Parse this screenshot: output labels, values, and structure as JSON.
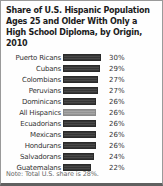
{
  "title": "Share of U.S. Hispanic Population Ages 25 and Older With Only a High School Diploma, by Origin, 2010",
  "note": "Note: Total U.S. share is 28%.",
  "colors": {
    "bar": "#3c3c3c",
    "highlight_bar": "#9b9b9b",
    "background": "#fefefe",
    "border": "#9a9a9a"
  },
  "chart_data": {
    "type": "bar",
    "orientation": "horizontal",
    "title": "Share of U.S. Hispanic Population Ages 25 and Older With Only a High School Diploma, by Origin, 2010",
    "categories": [
      "Puerto Ricans",
      "Cubans",
      "Colombians",
      "Peruvians",
      "Dominicans",
      "All Hispanics",
      "Ecuadorians",
      "Mexicans",
      "Hondurans",
      "Salvadorans",
      "Guatemalans"
    ],
    "values": [
      30,
      29,
      27,
      27,
      26,
      26,
      26,
      26,
      26,
      24,
      22
    ],
    "value_suffix": "%",
    "highlight_category": "All Hispanics",
    "xlim": [
      0,
      33
    ],
    "grid": false,
    "legend": false,
    "data_labels": true,
    "annotation": "Note: Total U.S. share is 28%."
  }
}
